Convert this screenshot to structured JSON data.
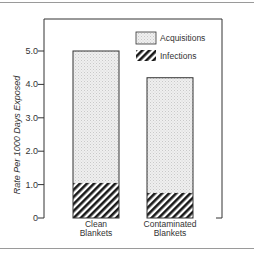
{
  "chart_data": {
    "type": "bar",
    "stacked": true,
    "title": "",
    "xlabel": "",
    "ylabel": "Rate Per 1000 Days Exposed",
    "ylim": [
      0,
      5.0
    ],
    "yticks": [
      "0",
      "1.0",
      "2.0",
      "3.0",
      "4.0",
      "5.0"
    ],
    "ytick_values": [
      0,
      1,
      2,
      3,
      4,
      5
    ],
    "categories": [
      "Clean Blankets",
      "Contaminated Blankets"
    ],
    "category_lines": [
      [
        "Clean",
        "Blankets"
      ],
      [
        "Contaminated",
        "Blankets"
      ]
    ],
    "totals": [
      5.0,
      4.2
    ],
    "series": [
      {
        "name": "Infections",
        "values": [
          1.05,
          0.75
        ],
        "pattern": "diagonal-hatch"
      },
      {
        "name": "Acquisitions",
        "values": [
          3.95,
          3.45
        ],
        "pattern": "light-stipple"
      }
    ],
    "legend": {
      "position": "upper-right",
      "entries": [
        "Acquisitions",
        "Infections"
      ]
    },
    "grid": false
  },
  "colors": {
    "acquisitions_fill": "#ececec",
    "hatch_dark": "#1a1a1a",
    "axis": "#333333"
  }
}
